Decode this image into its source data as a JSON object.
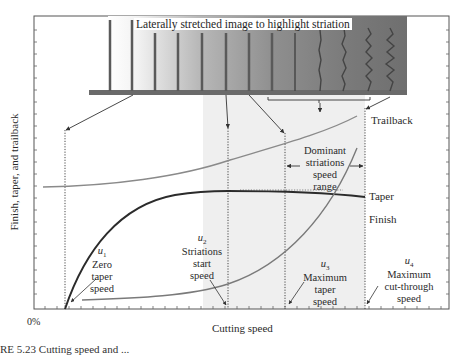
{
  "figure": {
    "strip_title": "Laterally stretched image to highlight striation",
    "y_axis_label": "Finish, taper, and trailback",
    "x_axis_label": "Cutting speed",
    "x_origin_label": "0%",
    "caption_partial": "RE 5.23   Cutting speed and ..."
  },
  "curves": {
    "trailback": "Trailback",
    "taper": "Taper",
    "finish": "Finish"
  },
  "range_annotation": {
    "line1": "Dominant",
    "line2": "striations",
    "line3": "speed",
    "line4": "range"
  },
  "speeds": [
    {
      "symbol": "u",
      "sub": "1",
      "line1": "Zero",
      "line2": "taper",
      "line3": "speed"
    },
    {
      "symbol": "u",
      "sub": "2",
      "line1": "Striations",
      "line2": "start",
      "line3": "speed"
    },
    {
      "symbol": "u",
      "sub": "3",
      "line1": "Maximum",
      "line2": "taper",
      "line3": "speed"
    },
    {
      "symbol": "u",
      "sub": "4",
      "line1": "Maximum",
      "line2": "cut-through",
      "line3": "speed"
    }
  ],
  "colors": {
    "frame": "#555555",
    "taper_curve": "#2b2b2b",
    "trailback_curve": "#8a8a8a",
    "finish_curve": "#7a7a7a",
    "shaded_region": "#efefef",
    "strip_dark": "#6e6e6e"
  }
}
